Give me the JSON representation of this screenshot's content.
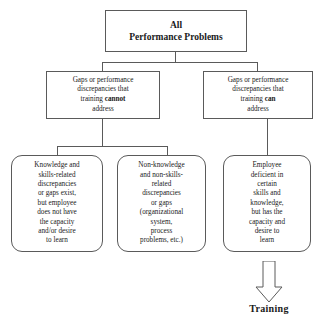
{
  "diagram": {
    "line_color": "#5a5a5a",
    "box_fill": "#ffffff",
    "root": {
      "label": "All\nPerformance Problems"
    },
    "branches": [
      {
        "id": "cannot",
        "line1": "Gaps or performance",
        "line2": "discrepancies that",
        "line3_prefix": "training ",
        "line3_emphasis": "cannot",
        "line4": "address"
      },
      {
        "id": "can",
        "line1": "Gaps or performance",
        "line2": "discrepancies that",
        "line3_prefix": "training ",
        "line3_emphasis": "can",
        "line4": "address"
      }
    ],
    "leaves": [
      {
        "id": "knowledge",
        "label": "Knowledge and\nskills-related\ndiscrepancies\nor gaps exist,\nbut employee\ndoes not have\nthe capacity\nand/or desire\nto learn"
      },
      {
        "id": "non-knowledge",
        "label": "Non-knowledge\nand non-skills-\nrelated\ndiscrepancies\nor gaps\n(organizational\nsystem,\nprocess\nproblems, etc.)"
      },
      {
        "id": "employee",
        "label": "Employee\ndeficient in\ncertain\nskills and\nknowledge,\nbut has the\ncapacity and\ndesire to\nlearn"
      }
    ],
    "outcome": {
      "label": "Training",
      "arrow_icon": "down-block-arrow-icon"
    }
  }
}
